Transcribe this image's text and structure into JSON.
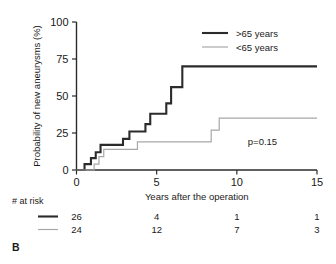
{
  "panel": {
    "label": "B"
  },
  "chart_data": {
    "type": "line",
    "title": "",
    "subtitle": "",
    "xlabel": "Years after the operation",
    "ylabel": "Probability of new aneurysms (%)",
    "xlim": [
      0,
      15
    ],
    "ylim": [
      0,
      100
    ],
    "xticks": [
      0,
      5,
      10,
      15
    ],
    "xticklabels": [
      "0",
      "5",
      "10",
      "15"
    ],
    "yticks": [
      0,
      25,
      50,
      75,
      100
    ],
    "yticklabels": [
      "0",
      "25",
      "50",
      "75",
      "100"
    ],
    "grid": false,
    "legend_position": "top-right",
    "annotations": [
      {
        "name": "p-value",
        "text": "p=0.15",
        "x": 11.6,
        "y": 17
      }
    ],
    "series": [
      {
        "name": ">65 years",
        "label": ">65 years",
        "color": "#2b2b2b",
        "linewidth": 2.1,
        "style": "step-post",
        "points": [
          [
            0.0,
            0.0
          ],
          [
            0.5,
            0.0
          ],
          [
            0.5,
            4.0
          ],
          [
            0.9,
            4.0
          ],
          [
            0.9,
            8.0
          ],
          [
            1.2,
            8.0
          ],
          [
            1.2,
            12.0
          ],
          [
            1.5,
            12.0
          ],
          [
            1.5,
            17.0
          ],
          [
            2.9,
            17.0
          ],
          [
            2.9,
            21.0
          ],
          [
            3.3,
            21.0
          ],
          [
            3.3,
            26.0
          ],
          [
            4.3,
            26.0
          ],
          [
            4.3,
            31.0
          ],
          [
            4.6,
            31.0
          ],
          [
            4.6,
            38.0
          ],
          [
            5.6,
            38.0
          ],
          [
            5.6,
            45.0
          ],
          [
            5.9,
            45.0
          ],
          [
            5.9,
            56.0
          ],
          [
            6.6,
            56.0
          ],
          [
            6.6,
            70.0
          ],
          [
            15.0,
            70.0
          ]
        ]
      },
      {
        "name": "<65 years",
        "label": "<65 years",
        "color": "#a8a8a8",
        "linewidth": 1.2,
        "style": "step-post",
        "points": [
          [
            0.0,
            0.0
          ],
          [
            1.1,
            0.0
          ],
          [
            1.1,
            4.0
          ],
          [
            1.4,
            4.0
          ],
          [
            1.4,
            9.0
          ],
          [
            1.7,
            9.0
          ],
          [
            1.7,
            14.0
          ],
          [
            3.8,
            14.0
          ],
          [
            3.8,
            19.0
          ],
          [
            8.4,
            19.0
          ],
          [
            8.4,
            27.0
          ],
          [
            8.9,
            27.0
          ],
          [
            8.9,
            35.0
          ],
          [
            15.0,
            35.0
          ]
        ]
      }
    ]
  },
  "risk_table": {
    "title": "# at risk",
    "times": [
      0,
      5,
      10,
      15
    ],
    "rows": [
      {
        "series": ">65 years",
        "color": "#2b2b2b",
        "linewidth": 2.1,
        "values": [
          "26",
          "4",
          "1",
          "1"
        ]
      },
      {
        "series": "<65 years",
        "color": "#a8a8a8",
        "linewidth": 1.2,
        "values": [
          "24",
          "12",
          "7",
          "3"
        ]
      }
    ]
  }
}
